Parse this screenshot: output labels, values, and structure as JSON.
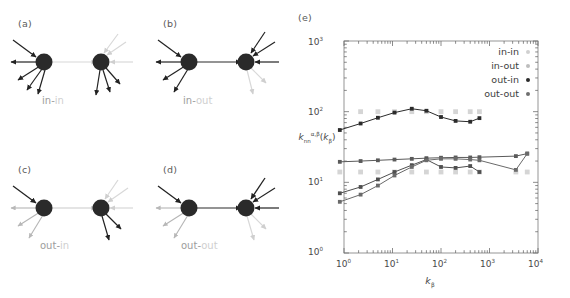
{
  "figure": {
    "panels": [
      {
        "tag": "(a)",
        "caption_first": "in",
        "caption_second": "in",
        "caption": "in-in"
      },
      {
        "tag": "(b)",
        "caption_first": "in",
        "caption_second": "out",
        "caption": "in-out"
      },
      {
        "tag": "(c)",
        "caption_first": "out",
        "caption_second": "in",
        "caption": "out-in"
      },
      {
        "tag": "(d)",
        "caption_first": "out",
        "caption_second": "out",
        "caption": "out-out"
      },
      {
        "tag": "(e)",
        "caption": ""
      }
    ]
  },
  "chart_data": {
    "type": "scatter",
    "title": "",
    "xlabel": "k_beta",
    "xlabel_base": "k",
    "xlabel_sub": "β",
    "ylabel": "k_nn^{α,β}(k_β)",
    "ylabel_base": "k",
    "ylabel_sub": "nn",
    "ylabel_sup": "α,β",
    "ylabel_arg_base": "k",
    "ylabel_arg_sub": "β",
    "xscale": "log",
    "yscale": "log",
    "xlim": [
      1,
      10000
    ],
    "ylim": [
      1,
      1000
    ],
    "grid": false,
    "legend_position": "top-right",
    "xticks": [
      "10",
      "10",
      "10",
      "10",
      "10"
    ],
    "xtick_exponents": [
      "0",
      "1",
      "2",
      "3",
      "4"
    ],
    "yticks": [
      "10",
      "10",
      "10",
      "10"
    ],
    "ytick_exponents": [
      "0",
      "1",
      "2",
      "3"
    ],
    "series": [
      {
        "name": "in-in",
        "color": "#d5d5d5",
        "line": false,
        "x": [
          2.2,
          5.0,
          11.0,
          25.0,
          50.0,
          100.0,
          200.0,
          400.0,
          620.0
        ],
        "y": [
          100,
          100,
          100,
          100,
          100,
          100,
          100,
          100,
          100
        ]
      },
      {
        "name": "in-out",
        "color": "#d5d5d5",
        "line": false,
        "x": [
          0.82,
          2.2,
          5.0,
          11.0,
          25.0,
          50.0,
          100.0,
          200.0,
          400.0,
          620.0,
          3500.0,
          6000.0
        ],
        "y": [
          14,
          14,
          14,
          14,
          14,
          14,
          14,
          14,
          14,
          14,
          14,
          14
        ]
      },
      {
        "name": "out-in",
        "color": "#2b2b2b",
        "line": true,
        "x": [
          0.82,
          2.2,
          5.0,
          11.0,
          25.0,
          50.0,
          100.0,
          200.0,
          400.0,
          620.0
        ],
        "y": [
          55,
          68,
          82,
          97,
          110,
          103,
          84,
          74,
          72,
          81
        ]
      },
      {
        "name": "out-out",
        "color": "#5a5a5a",
        "line": true,
        "x": [
          0.82,
          2.2,
          5.0,
          11.0,
          25.0,
          50.0,
          100.0,
          200.0,
          400.0,
          620.0,
          3500.0,
          6000.0
        ],
        "y": [
          19.5,
          20.0,
          20.5,
          21.0,
          21.5,
          22.0,
          22.3,
          22.5,
          22.5,
          22.7,
          23.5,
          25.5
        ]
      },
      {
        "name": "out-out-b",
        "color": "#4f4f4f",
        "line": true,
        "x": [
          0.82,
          2.2,
          5.0,
          11.0,
          25.0,
          50.0,
          100.0,
          200.0,
          400.0,
          620.0
        ],
        "y": [
          7.0,
          8.6,
          11.0,
          14.0,
          17.5,
          21.0,
          16.5,
          16.0,
          17.0,
          14.0
        ]
      },
      {
        "name": "out-out-c",
        "color": "#6a6a6a",
        "line": true,
        "x": [
          0.82,
          2.2,
          5.0,
          11.0,
          25.0,
          50.0,
          100.0,
          200.0,
          400.0,
          620.0,
          3500.0,
          6000.0
        ],
        "y": [
          5.3,
          6.7,
          9.0,
          12.5,
          16.5,
          20.5,
          21.5,
          21.5,
          21.0,
          20.5,
          15.0,
          25.5
        ]
      }
    ],
    "legend": [
      {
        "label": "in-in",
        "color": "#d0d0d0"
      },
      {
        "label": "in-out",
        "color": "#bdbdbd"
      },
      {
        "label": "out-in",
        "color": "#2b2b2b"
      },
      {
        "label": "out-out",
        "color": "#6f6f6f"
      }
    ]
  }
}
